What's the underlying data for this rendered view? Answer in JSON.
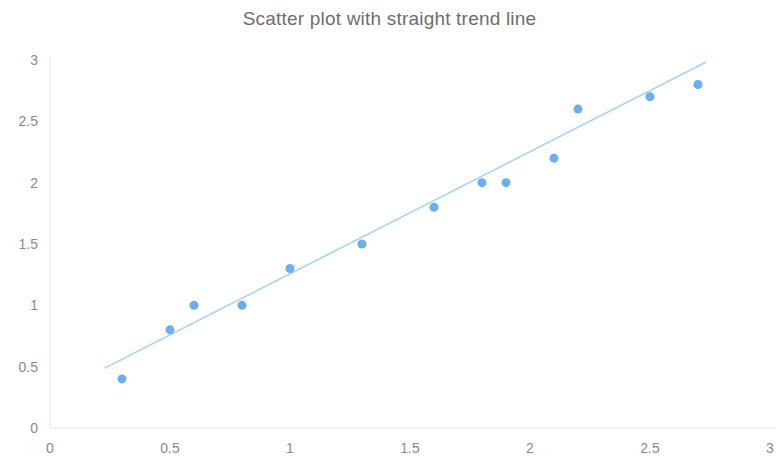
{
  "chart_data": {
    "type": "scatter",
    "title": "Scatter plot with straight trend line",
    "xlabel": "",
    "ylabel": "",
    "xlim": [
      0,
      3
    ],
    "ylim": [
      0,
      3
    ],
    "xticks": [
      "0",
      "0.5",
      "1",
      "1.5",
      "2",
      "2.5",
      "3"
    ],
    "xtick_values": [
      0,
      0.5,
      1,
      1.5,
      2,
      2.5,
      3
    ],
    "yticks": [
      "0",
      "0.5",
      "1",
      "1.5",
      "2",
      "2.5",
      "3"
    ],
    "ytick_values": [
      0,
      0.5,
      1,
      1.5,
      2,
      2.5,
      3
    ],
    "grid": false,
    "legend": "none",
    "series": [
      {
        "name": "points",
        "type": "scatter",
        "marker_color": "#6CADEE",
        "marker_size": 9,
        "points": [
          {
            "x": 0.3,
            "y": 0.4
          },
          {
            "x": 0.5,
            "y": 0.8
          },
          {
            "x": 0.6,
            "y": 1.0
          },
          {
            "x": 0.8,
            "y": 1.0
          },
          {
            "x": 1.0,
            "y": 1.3
          },
          {
            "x": 1.3,
            "y": 1.5
          },
          {
            "x": 1.6,
            "y": 1.8
          },
          {
            "x": 1.8,
            "y": 2.0
          },
          {
            "x": 1.9,
            "y": 2.0
          },
          {
            "x": 2.1,
            "y": 2.2
          },
          {
            "x": 2.2,
            "y": 2.6
          },
          {
            "x": 2.5,
            "y": 2.7
          },
          {
            "x": 2.7,
            "y": 2.8
          }
        ]
      },
      {
        "name": "trend line",
        "type": "line",
        "line_color": "#A8D2F5",
        "line_width": 1.6,
        "points": [
          {
            "x": 0.23,
            "y": 0.49
          },
          {
            "x": 2.73,
            "y": 2.98
          }
        ]
      }
    ],
    "axis_color": "#EDEDED",
    "tick_text_color": "#8A8A8A",
    "title_color": "#6E6E6E",
    "background_color": "#FFFFFF"
  }
}
